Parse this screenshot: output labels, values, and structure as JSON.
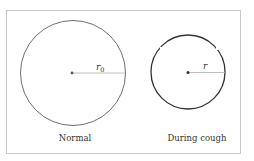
{
  "figure": {
    "frame": {
      "stroke": "#c8c8c8"
    },
    "normal": {
      "caption": "Normal",
      "radius_label": "r",
      "radius_sub": "0",
      "stroke": "#6e6e6e"
    },
    "cough": {
      "caption": "During cough",
      "radius_label": "r",
      "stroke": "#333333"
    },
    "radius_line_color": "#b0b0b0",
    "center_dot_color": "#555555"
  }
}
